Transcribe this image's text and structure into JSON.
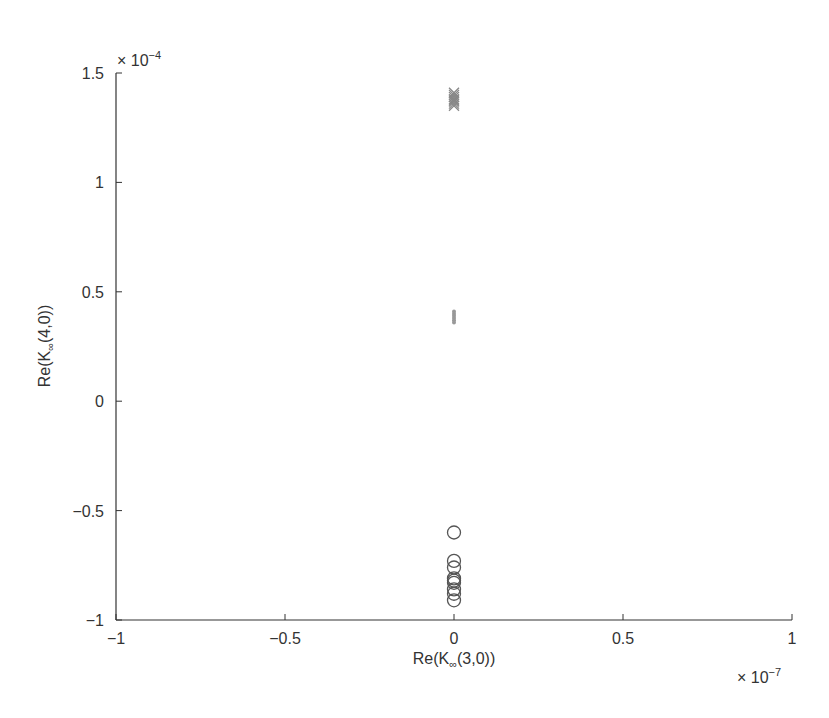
{
  "chart_data": {
    "type": "scatter",
    "title": "",
    "xlabel": "Re(K∞(3,0))",
    "ylabel": "Re(K∞(4,0))",
    "xlabel_parts": {
      "pre": "Re(K",
      "sub": "∞",
      "post": "(3,0))"
    },
    "ylabel_parts": {
      "pre": "Re(K",
      "sub": "∞",
      "post": "(4,0))"
    },
    "x_multiplier": "× 10⁻⁷",
    "y_multiplier": "× 10⁻⁴",
    "x_multiplier_parts": {
      "base": "× 10",
      "exp": "−7"
    },
    "y_multiplier_parts": {
      "base": "× 10",
      "exp": "−4"
    },
    "xlim": [
      -1,
      1
    ],
    "ylim": [
      -1,
      1.5
    ],
    "xticks": [
      -1,
      -0.5,
      0,
      0.5,
      1
    ],
    "xtick_labels": [
      "−1",
      "−0.5",
      "0",
      "0.5",
      "1"
    ],
    "yticks": [
      -1,
      -0.5,
      0,
      0.5,
      1,
      1.5
    ],
    "ytick_labels": [
      "−1",
      "−0.5",
      "0",
      "0.5",
      "1",
      "1.5"
    ],
    "grid": false,
    "legend": null,
    "series": [
      {
        "name": "cross-markers",
        "marker": "x",
        "color": "#888888",
        "x": [
          0,
          0,
          0,
          0,
          0,
          0,
          0,
          0
        ],
        "y": [
          1.41,
          1.4,
          1.39,
          1.38,
          1.375,
          1.37,
          1.36,
          1.35
        ]
      },
      {
        "name": "dot-markers",
        "marker": ".",
        "color": "#999999",
        "x": [
          0,
          0,
          0,
          0,
          0,
          0
        ],
        "y": [
          0.41,
          0.4,
          0.39,
          0.38,
          0.37,
          0.36
        ]
      },
      {
        "name": "circle-markers",
        "marker": "o",
        "color": "#555555",
        "x": [
          0,
          0,
          0,
          0,
          0,
          0,
          0,
          0,
          0
        ],
        "y": [
          -0.6,
          -0.73,
          -0.76,
          -0.81,
          -0.82,
          -0.83,
          -0.86,
          -0.88,
          -0.91
        ]
      }
    ]
  }
}
